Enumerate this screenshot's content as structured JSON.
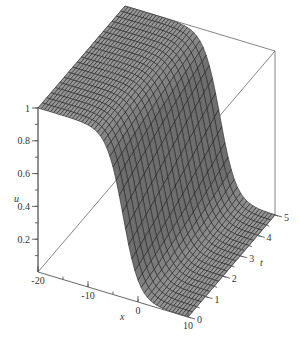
{
  "chart_data": {
    "type": "surface3d",
    "title": "",
    "function_description": "kink solution u(x,t) descending from 1 to 0 across x, slowly shifting with t",
    "axes": {
      "x": {
        "label": "x",
        "range": [
          -20,
          10
        ],
        "ticks": [
          -20,
          -10,
          0,
          10
        ],
        "tick_labels": [
          "-20",
          "-10",
          "0",
          "10"
        ]
      },
      "t": {
        "label": "t",
        "range": [
          0,
          5
        ],
        "ticks": [
          0,
          1,
          2,
          3,
          4,
          5
        ],
        "tick_labels": [
          "0",
          "1",
          "2",
          "3",
          "4",
          "5"
        ]
      },
      "u": {
        "label": "u",
        "range": [
          0,
          1
        ],
        "ticks": [
          0.2,
          0.4,
          0.6,
          0.8,
          1
        ],
        "tick_labels": [
          "0.2",
          "0.4",
          "0.6",
          "0.8",
          "1"
        ]
      }
    },
    "surface": {
      "model": "u = 0.5 * (1 - tanh((x - x0 - c*t) / w))",
      "x0": -3,
      "c": 0.4,
      "w": 3.2,
      "grid_x": 49,
      "grid_t": 21,
      "fill_color": "#8c8c8c",
      "mesh_color": "#1a1a1a"
    },
    "box": true,
    "grid": false,
    "legend": null
  }
}
